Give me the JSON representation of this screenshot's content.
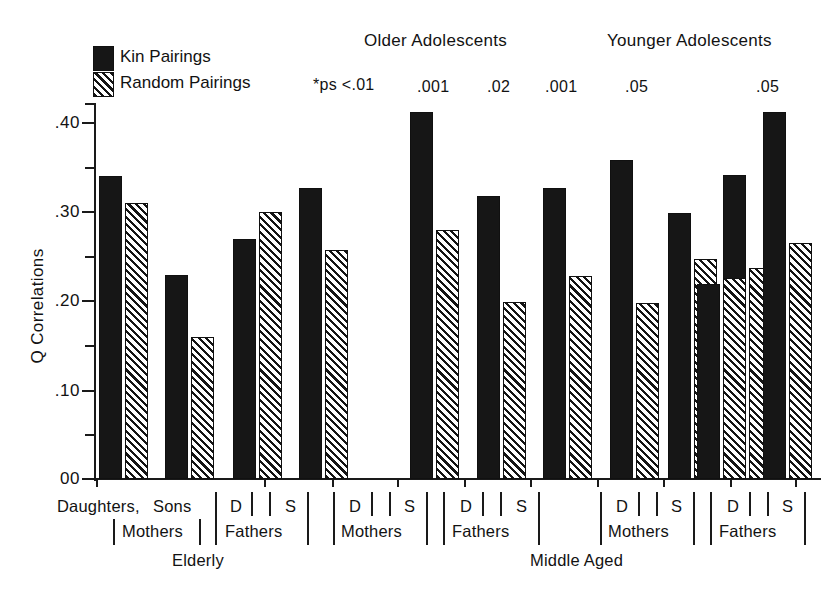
{
  "chart_data": {
    "type": "bar",
    "title": "",
    "xlabel": "",
    "ylabel": "Q Correlations",
    "ylim": [
      0.0,
      0.45
    ],
    "grid": false,
    "legend_position": "top-left",
    "ytick_labels": [
      "00",
      ".10",
      ".20",
      ".30",
      ".40"
    ],
    "ytick_values": [
      0.0,
      0.1,
      0.2,
      0.3,
      0.4
    ],
    "yminor_values": [
      0.05,
      0.15,
      0.25,
      0.35,
      0.45
    ],
    "series": [
      {
        "name": "Kin Pairings",
        "values": [
          0.34,
          0.229,
          0.269,
          0.326,
          0.411,
          0.317,
          0.326,
          0.357,
          0.341,
          0.298,
          0.218,
          0.411
        ]
      },
      {
        "name": "Random Pairings",
        "values": [
          0.309,
          0.159,
          0.299,
          0.257,
          0.279,
          0.198,
          0.228,
          0.197,
          0.237,
          0.247,
          0.225,
          0.264
        ]
      }
    ],
    "categories": [
      "Daughters/Mothers (Elderly)",
      "Sons/Mothers (Elderly)",
      "D/Fathers (Elderly)",
      "S/Fathers (Elderly)",
      "D/Mothers (Older Adolescents)",
      "S/Mothers (Older Adolescents)",
      "D/Fathers (Older Adolescents)",
      "S/Fathers (Older Adolescents)",
      "D/Mothers (Younger Adolescents)",
      "S/Mothers (Younger Adolescents)",
      "D/Fathers (Younger Adolescents)",
      "S/Fathers (Younger Adolescents)"
    ],
    "annotations": [
      {
        "text": "*ps <.01",
        "for": "D/Mothers (Older Adolescents)"
      },
      {
        "text": ".001",
        "for": "S/Mothers (Older Adolescents)"
      },
      {
        "text": ".02",
        "for": "D/Fathers (Older Adolescents)"
      },
      {
        "text": ".001",
        "for": "S/Fathers (Older Adolescents)"
      },
      {
        "text": ".05",
        "for": "D/Mothers (Younger Adolescents)"
      },
      {
        "text": ".05",
        "for": "S/Fathers (Younger Adolescents)"
      }
    ]
  },
  "legend": {
    "kin_label": "Kin Pairings",
    "random_label": "Random Pairings"
  },
  "headers": {
    "older": "Older Adolescents",
    "younger": "Younger Adolescents"
  },
  "pvalues": {
    "p1": "*ps <.01",
    "p2": ".001",
    "p3": ".02",
    "p4": ".001",
    "p5": ".05",
    "p6": ".05"
  },
  "axis": {
    "ytitle": "Q Correlations",
    "t0": "00",
    "t1": ".10",
    "t2": ".20",
    "t3": ".30",
    "t4": ".40"
  },
  "xlabels": {
    "g1_daughters": "Daughters,",
    "g1_sons": "Sons",
    "g1_mothers": "Mothers",
    "g1_d": "D",
    "g1_s": "S",
    "g1_fathers": "Fathers",
    "g1_group": "Elderly",
    "g2_d1": "D",
    "g2_s1": "S",
    "g2_mothers": "Mothers",
    "g2_d2": "D",
    "g2_s2": "S",
    "g2_fathers": "Fathers",
    "g2_group": "Middle Aged",
    "g3_d1": "D",
    "g3_s1": "S",
    "g3_mothers": "Mothers",
    "g3_d2": "D",
    "g3_s2": "S",
    "g3_fathers": "Fathers"
  },
  "colors": {
    "ink": "#161616",
    "background": "#ffffff"
  }
}
